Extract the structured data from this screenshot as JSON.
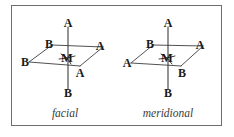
{
  "figure": {
    "border_color": "#6e6e6e",
    "line_color": "#3d3d3d",
    "label_color": "#1a1a1a",
    "caption_color": "#3a3a3a",
    "background": "#ffffff"
  },
  "diagrams": [
    {
      "id": "facial",
      "caption": "facial",
      "caption_pos": {
        "x": 65,
        "y": 113
      },
      "center": {
        "label": "M",
        "x": 67,
        "y": 58
      },
      "vertices": [
        {
          "name": "axial-top",
          "label": "A",
          "x": 68,
          "y": 23,
          "bond_to": {
            "x": 68,
            "y": 49
          }
        },
        {
          "name": "axial-bottom",
          "label": "B",
          "x": 68,
          "y": 93,
          "bond_to": {
            "x": 68,
            "y": 67
          }
        },
        {
          "name": "equatorial-upper-left",
          "label": "B",
          "x": 49,
          "y": 44,
          "bond_to": {
            "x": 61,
            "y": 54
          }
        },
        {
          "name": "equatorial-left",
          "label": "B",
          "x": 25,
          "y": 62,
          "bond_to": {
            "x": 59,
            "y": 59
          }
        },
        {
          "name": "equatorial-right",
          "label": "A",
          "x": 100,
          "y": 46,
          "bond_to": {
            "x": 75,
            "y": 56
          }
        },
        {
          "name": "equatorial-lower-right",
          "label": "A",
          "x": 80,
          "y": 73,
          "bond_to": {
            "x": 71,
            "y": 64
          }
        }
      ],
      "plane_polygon": [
        {
          "x": 29,
          "y": 62
        },
        {
          "x": 52,
          "y": 45
        },
        {
          "x": 103,
          "y": 47
        },
        {
          "x": 80,
          "y": 66
        }
      ],
      "axis_line": {
        "x1": 68,
        "y1": 27,
        "x2": 68,
        "y2": 89
      }
    },
    {
      "id": "meridional",
      "caption": "meridional",
      "caption_pos": {
        "x": 168,
        "y": 113
      },
      "center": {
        "label": "M",
        "x": 167,
        "y": 58
      },
      "vertices": [
        {
          "name": "axial-top",
          "label": "A",
          "x": 168,
          "y": 23,
          "bond_to": {
            "x": 168,
            "y": 49
          }
        },
        {
          "name": "axial-bottom",
          "label": "B",
          "x": 168,
          "y": 93,
          "bond_to": {
            "x": 168,
            "y": 67
          }
        },
        {
          "name": "equatorial-upper-left",
          "label": "B",
          "x": 150,
          "y": 44,
          "bond_to": {
            "x": 161,
            "y": 54
          }
        },
        {
          "name": "equatorial-left",
          "label": "A",
          "x": 127,
          "y": 63,
          "bond_to": {
            "x": 159,
            "y": 59
          }
        },
        {
          "name": "equatorial-right",
          "label": "A",
          "x": 200,
          "y": 45,
          "bond_to": {
            "x": 175,
            "y": 56
          }
        },
        {
          "name": "equatorial-lower-right",
          "label": "B",
          "x": 182,
          "y": 73,
          "bond_to": {
            "x": 172,
            "y": 64
          }
        }
      ],
      "plane_polygon": [
        {
          "x": 131,
          "y": 63
        },
        {
          "x": 153,
          "y": 45
        },
        {
          "x": 203,
          "y": 46
        },
        {
          "x": 181,
          "y": 66
        }
      ],
      "axis_line": {
        "x1": 168,
        "y1": 27,
        "x2": 168,
        "y2": 89
      }
    }
  ]
}
